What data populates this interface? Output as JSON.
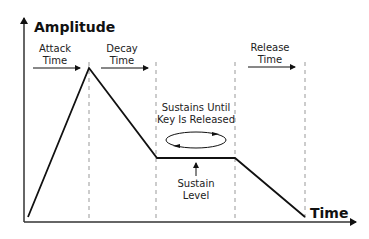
{
  "diagram": {
    "type": "ADSR envelope",
    "axes": {
      "y_label": "Amplitude",
      "x_label": "Time"
    },
    "phases": [
      {
        "name": "attack",
        "label_line1": "Attack",
        "label_line2": "Time"
      },
      {
        "name": "decay",
        "label_line1": "Decay",
        "label_line2": "Time"
      },
      {
        "name": "release",
        "label_line1": "Release",
        "label_line2": "Time"
      }
    ],
    "sustain_note": {
      "line1": "Sustains Until",
      "line2": "Key Is Released"
    },
    "sustain_level": {
      "line1": "Sustain",
      "line2": "Level"
    },
    "envelope_points": [
      {
        "x": 28,
        "y": 217
      },
      {
        "x": 89,
        "y": 68
      },
      {
        "x": 157,
        "y": 158
      },
      {
        "x": 235,
        "y": 158
      },
      {
        "x": 305,
        "y": 217
      }
    ],
    "colors": {
      "line": "#111111",
      "dashed": "#999999",
      "background": "#ffffff"
    }
  }
}
